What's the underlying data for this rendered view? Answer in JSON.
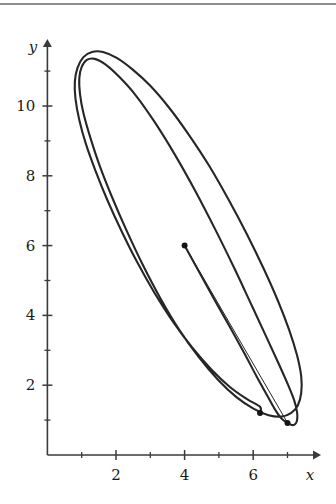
{
  "figure": {
    "kind": "phase-plane-trajectory",
    "background_color": "#ffffff",
    "curve_color": "#262626",
    "axis_color": "#3a3a3a",
    "rule_color": "#8e8e8e"
  },
  "axes": {
    "x": {
      "label": "x",
      "major_ticks": [
        2,
        4,
        6
      ],
      "major_tick_labels": [
        "2",
        "4",
        "6"
      ],
      "minor_ticks": [
        1,
        3,
        5,
        7
      ],
      "range": [
        0,
        7.9
      ],
      "origin_px": 47.4,
      "scale_px_per_unit": 34.3
    },
    "y": {
      "label": "y",
      "major_ticks": [
        2,
        4,
        6,
        8,
        10
      ],
      "major_tick_labels": [
        "2",
        "4",
        "6",
        "8",
        "10"
      ],
      "minor_ticks": [
        1,
        3,
        5,
        7,
        9,
        11
      ],
      "range": [
        0,
        11.9
      ],
      "origin_px": 455,
      "scale_px_per_unit": 34.9
    }
  },
  "chart_data": {
    "type": "line",
    "title": "",
    "xlabel": "x",
    "ylabel": "y",
    "xlim": [
      0,
      7.9
    ],
    "ylim": [
      0,
      11.9
    ],
    "grid": false,
    "legend": "none",
    "x_major_ticks": [
      2,
      4,
      6
    ],
    "y_major_ticks": [
      2,
      4,
      6,
      8,
      10
    ],
    "x_minor_ticks": [
      1,
      3,
      5,
      7
    ],
    "y_minor_ticks": [
      1,
      3,
      5,
      7,
      9,
      11
    ],
    "series": [
      {
        "name": "trajectory",
        "style": "solid",
        "linewidth": 2.1,
        "points": [
          [
            4.0,
            6.0
          ],
          [
            4.45,
            5.2
          ],
          [
            4.9,
            4.4
          ],
          [
            5.35,
            3.62
          ],
          [
            5.75,
            2.9
          ],
          [
            6.1,
            2.25
          ],
          [
            6.4,
            1.72
          ],
          [
            6.62,
            1.33
          ],
          [
            6.82,
            1.05
          ],
          [
            7.0,
            0.92
          ],
          [
            7.12,
            0.86
          ],
          [
            7.22,
            0.88
          ],
          [
            7.28,
            1.0
          ],
          [
            7.28,
            1.22
          ],
          [
            7.2,
            1.55
          ],
          [
            7.02,
            2.0
          ],
          [
            6.75,
            2.6
          ],
          [
            6.4,
            3.35
          ],
          [
            5.95,
            4.3
          ],
          [
            5.45,
            5.35
          ],
          [
            4.9,
            6.45
          ],
          [
            4.32,
            7.55
          ],
          [
            3.72,
            8.6
          ],
          [
            3.12,
            9.55
          ],
          [
            2.58,
            10.3
          ],
          [
            2.08,
            10.85
          ],
          [
            1.68,
            11.2
          ],
          [
            1.38,
            11.35
          ],
          [
            1.15,
            11.32
          ],
          [
            1.0,
            11.12
          ],
          [
            0.93,
            10.8
          ],
          [
            0.95,
            10.35
          ],
          [
            1.05,
            9.8
          ],
          [
            1.25,
            9.1
          ],
          [
            1.52,
            8.3
          ],
          [
            1.88,
            7.4
          ],
          [
            2.3,
            6.45
          ],
          [
            2.78,
            5.45
          ],
          [
            3.3,
            4.48
          ],
          [
            3.85,
            3.58
          ],
          [
            4.42,
            2.8
          ],
          [
            4.98,
            2.15
          ],
          [
            5.52,
            1.65
          ],
          [
            6.02,
            1.32
          ],
          [
            6.45,
            1.14
          ],
          [
            6.82,
            1.1
          ],
          [
            7.1,
            1.2
          ],
          [
            7.3,
            1.42
          ],
          [
            7.4,
            1.78
          ],
          [
            7.4,
            2.25
          ],
          [
            7.28,
            2.85
          ],
          [
            7.05,
            3.58
          ],
          [
            6.72,
            4.42
          ],
          [
            6.3,
            5.35
          ],
          [
            5.82,
            6.32
          ],
          [
            5.28,
            7.32
          ],
          [
            4.72,
            8.28
          ],
          [
            4.12,
            9.18
          ],
          [
            3.55,
            9.95
          ],
          [
            3.0,
            10.58
          ],
          [
            2.48,
            11.05
          ],
          [
            2.02,
            11.38
          ],
          [
            1.62,
            11.55
          ],
          [
            1.3,
            11.55
          ],
          [
            1.05,
            11.4
          ],
          [
            0.88,
            11.1
          ],
          [
            0.8,
            10.7
          ],
          [
            0.82,
            10.2
          ],
          [
            0.93,
            9.6
          ],
          [
            1.12,
            8.92
          ],
          [
            1.4,
            8.15
          ],
          [
            1.75,
            7.3
          ],
          [
            2.16,
            6.42
          ],
          [
            2.62,
            5.52
          ],
          [
            3.12,
            4.65
          ],
          [
            3.66,
            3.82
          ],
          [
            4.22,
            3.08
          ],
          [
            4.78,
            2.45
          ],
          [
            5.32,
            1.95
          ],
          [
            5.82,
            1.6
          ],
          [
            6.2,
            1.38
          ],
          [
            6.2,
            1.2
          ]
        ]
      }
    ],
    "annotations": [
      {
        "name": "start-point",
        "x": 4.0,
        "y": 6.0,
        "marker": "dot"
      },
      {
        "name": "inner-end-point",
        "x": 6.2,
        "y": 1.2,
        "marker": "dot"
      },
      {
        "name": "outer-end-point",
        "x": 7.0,
        "y": 0.92,
        "marker": "dot"
      }
    ],
    "connector": {
      "name": "start-to-end-segment",
      "from": [
        4.0,
        6.0
      ],
      "to": [
        7.0,
        0.92
      ],
      "linewidth": 1.0
    }
  }
}
